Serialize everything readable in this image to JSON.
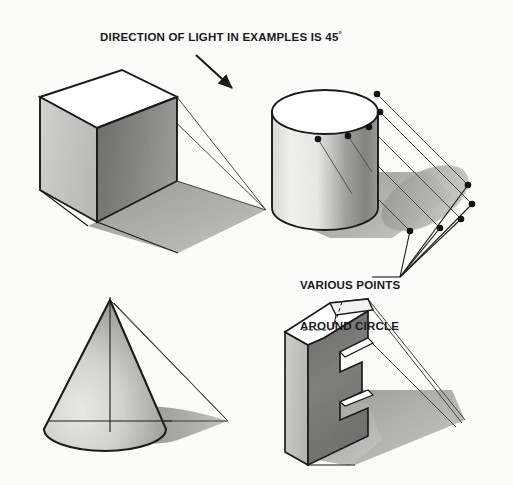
{
  "figure": {
    "title": "DIRECTION OF LIGHT IN EXAMPLES IS 45",
    "title_degree_symbol": "°",
    "annotation_line1": "VARIOUS POINTS",
    "annotation_line2": "AROUND CIRCLE",
    "background_color": "#fbfbfa",
    "ink_color": "#1a1a1a",
    "light_angle_degrees": 45,
    "objects": [
      {
        "name": "cube",
        "shading": {
          "top": "#ffffff",
          "left": "#c9c9c7",
          "right": "#8a8a88",
          "shadow": "#b4b4b2"
        }
      },
      {
        "name": "cylinder",
        "shading": {
          "top": "#ffffff",
          "body_light": "#efefed",
          "body_dark": "#8f8f8d",
          "shadow": "#b0b0ae"
        }
      },
      {
        "name": "cone",
        "shading": {
          "light": "#e6e6e4",
          "dark": "#9a9a98",
          "shadow": "#a9a9a7"
        }
      },
      {
        "name": "e-block",
        "shading": {
          "top": "#ffffff",
          "left": "#c6c6c4",
          "front": "#7e7e7c",
          "shadow": "#b2b2b0"
        }
      }
    ],
    "cylinder_rim_point_count": 5,
    "cylinder_shadow_point_count": 5,
    "icons": {
      "light_direction_arrow": "arrow-down-right-icon",
      "leader_line": "leader-line-icon"
    }
  }
}
